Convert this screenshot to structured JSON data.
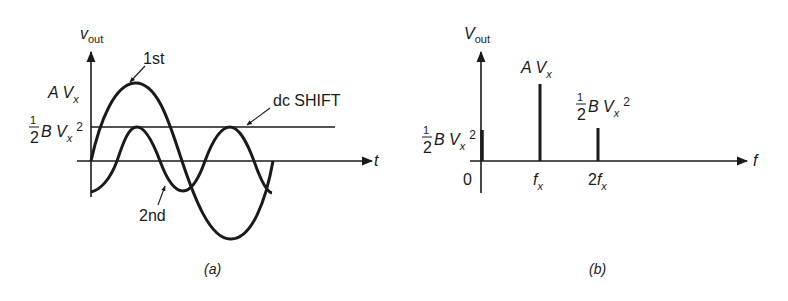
{
  "panel_a": {
    "caption": "(a)",
    "y_axis_label": {
      "main": "v",
      "sub": "out"
    },
    "x_axis_label": "t",
    "level_label_1": {
      "main": "A V",
      "sub": "x"
    },
    "level_label_2": {
      "frac_num": "1",
      "frac_den": "2",
      "main": "B V",
      "sub": "x",
      "sup": "2"
    },
    "curve_1_label": "1st",
    "curve_2_label": "2nd",
    "dc_label": "dc SHIFT"
  },
  "panel_b": {
    "caption": "(b)",
    "y_axis_label": {
      "main": "V",
      "sub": "out"
    },
    "x_axis_label": "f",
    "origin_label": "0",
    "tick_1": {
      "main": "f",
      "sub": "x"
    },
    "tick_2": {
      "pre": "2",
      "main": "f",
      "sub": "x"
    },
    "bar_0_label": {
      "frac_num": "1",
      "frac_den": "2",
      "main": "B V",
      "sub": "x",
      "sup": "2"
    },
    "bar_1_label": {
      "main": "A V",
      "sub": "x"
    },
    "bar_2_label": {
      "frac_num": "1",
      "frac_den": "2",
      "main": "B V",
      "sub": "x",
      "sup": "2"
    }
  },
  "colors": {
    "ink": "#1a1a1a",
    "background": "#ffffff"
  }
}
